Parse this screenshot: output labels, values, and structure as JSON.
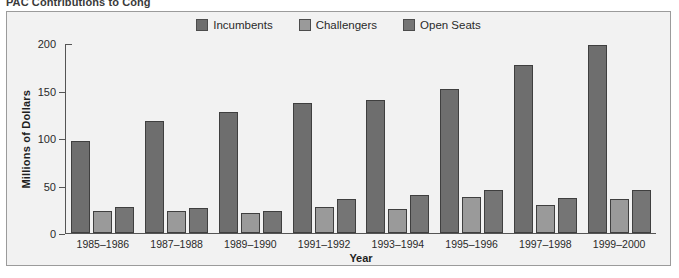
{
  "headline": "PAC Contributions to Cong",
  "chart_data": {
    "type": "bar",
    "title": "",
    "xlabel": "Year",
    "ylabel": "Millions of Dollars",
    "categories": [
      "1985–1986",
      "1987–1988",
      "1989–1990",
      "1991–1992",
      "1993–1994",
      "1995–1996",
      "1997–1998",
      "1999–2000"
    ],
    "series": [
      {
        "name": "Incumbents",
        "color": "#6e6e6e",
        "values": [
          97,
          119,
          128,
          138,
          141,
          152,
          178,
          199
        ]
      },
      {
        "name": "Challengers",
        "color": "#9a9a9a",
        "values": [
          23,
          23,
          21,
          28,
          25,
          38,
          30,
          36
        ]
      },
      {
        "name": "Open Seats",
        "color": "#757575",
        "values": [
          28,
          27,
          23,
          36,
          40,
          46,
          37,
          45
        ]
      }
    ],
    "yticks": [
      0,
      50,
      100,
      150,
      200
    ],
    "ylim": [
      0,
      200
    ],
    "grid": false,
    "legend_position": "top-center"
  },
  "colors": {
    "figure_background": "#f2f2f2",
    "figure_border": "#9b9b9b",
    "axis": "#555555",
    "bar_outline": "#3f3f3f"
  }
}
